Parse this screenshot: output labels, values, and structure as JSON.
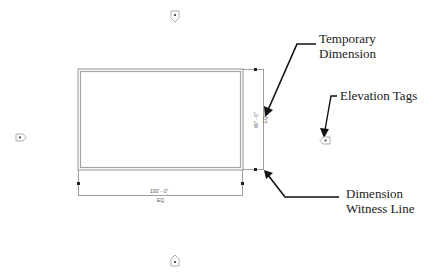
{
  "diagram": {
    "room": {
      "width_dimension": "100' - 0\"",
      "width_sub": "EQ",
      "height_dimension": "60' - 0\"",
      "height_sub": "EQ"
    },
    "callouts": [
      {
        "id": "temporary-dimension",
        "lines": [
          "Temporary",
          "Dimension"
        ]
      },
      {
        "id": "elevation-tags",
        "lines": [
          "Elevation Tags"
        ]
      },
      {
        "id": "dimension-witness-line",
        "lines": [
          "Dimension",
          "Witness Line"
        ]
      }
    ],
    "elevation_tags": [
      {
        "position": "top",
        "pointing": "down"
      },
      {
        "position": "left",
        "pointing": "right"
      },
      {
        "position": "right",
        "pointing": "left"
      },
      {
        "position": "bottom",
        "pointing": "up"
      }
    ],
    "colors": {
      "wall": "#9a9a9a",
      "dimension_line": "#777777",
      "arrow": "#111111",
      "text": "#1a1a1a"
    }
  }
}
